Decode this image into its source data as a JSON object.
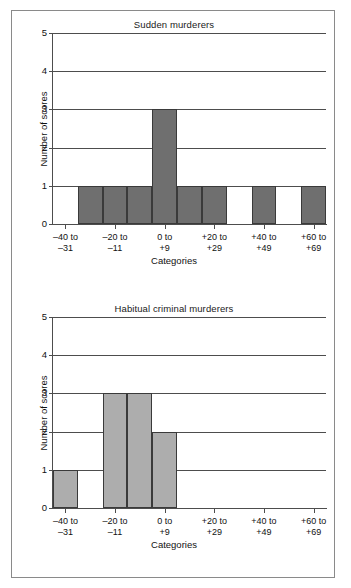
{
  "figure": {
    "background": "#ffffff",
    "border_color": "#8a8a8a"
  },
  "chart_data": [
    {
      "type": "bar",
      "title": "Sudden murderers",
      "xlabel": "Categories",
      "ylabel": "Number of scores",
      "ylim": [
        0,
        5
      ],
      "ytick_labels": [
        "0",
        "1",
        "2",
        "3",
        "4",
        "5"
      ],
      "yticks": [
        0,
        1,
        2,
        3,
        4,
        5
      ],
      "grid": true,
      "legend": "none",
      "bar_color": "#6f6f6f",
      "bar_edge_color": "#3a3a3a",
      "bins": [
        "-40 to -31",
        "-30 to -21",
        "-20 to -11",
        "-10 to -1",
        "0 to +9",
        "+10 to +19",
        "+20 to +29",
        "+30 to +39",
        "+40 to +49",
        "+50 to +59",
        "+60 to +69"
      ],
      "values": [
        0,
        1,
        1,
        1,
        3,
        1,
        1,
        0,
        1,
        0,
        1
      ],
      "labelled_bins": [
        {
          "index": 0,
          "line1": "–40 to",
          "line2": "–31"
        },
        {
          "index": 2,
          "line1": "–20 to",
          "line2": "–11"
        },
        {
          "index": 4,
          "line1": "0 to",
          "line2": "+9"
        },
        {
          "index": 6,
          "line1": "+20 to",
          "line2": "+29"
        },
        {
          "index": 8,
          "line1": "+40 to",
          "line2": "+49"
        },
        {
          "index": 10,
          "line1": "+60 to",
          "line2": "+69"
        }
      ]
    },
    {
      "type": "bar",
      "title": "Habitual criminal murderers",
      "xlabel": "Categories",
      "ylabel": "Number of scores",
      "ylim": [
        0,
        5
      ],
      "ytick_labels": [
        "0",
        "1",
        "2",
        "3",
        "4",
        "5"
      ],
      "yticks": [
        0,
        1,
        2,
        3,
        4,
        5
      ],
      "grid": true,
      "legend": "none",
      "bar_color": "#adadad",
      "bar_edge_color": "#3a3a3a",
      "bins": [
        "-40 to -31",
        "-30 to -21",
        "-20 to -11",
        "-10 to -1",
        "0 to +9",
        "+10 to +19",
        "+20 to +29",
        "+30 to +39",
        "+40 to +49",
        "+50 to +59",
        "+60 to +69"
      ],
      "values": [
        1,
        0,
        3,
        3,
        2,
        0,
        0,
        0,
        0,
        0,
        0
      ],
      "labelled_bins": [
        {
          "index": 0,
          "line1": "–40 to",
          "line2": "–31"
        },
        {
          "index": 2,
          "line1": "–20 to",
          "line2": "–11"
        },
        {
          "index": 4,
          "line1": "0 to",
          "line2": "+9"
        },
        {
          "index": 6,
          "line1": "+20 to",
          "line2": "+29"
        },
        {
          "index": 8,
          "line1": "+40 to",
          "line2": "+49"
        },
        {
          "index": 10,
          "line1": "+60 to",
          "line2": "+69"
        }
      ]
    }
  ]
}
